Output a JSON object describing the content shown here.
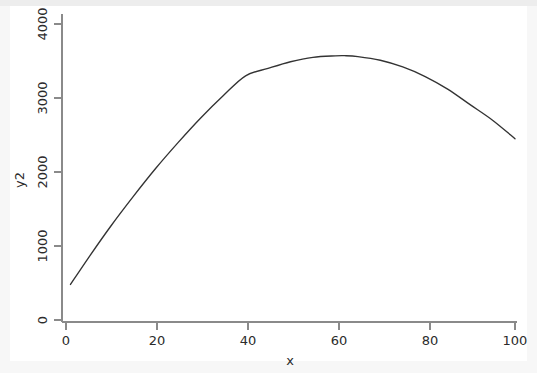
{
  "chart_data": {
    "type": "line",
    "title": "",
    "subtitle": "",
    "xlabel": "x",
    "ylabel": "y2",
    "xlim": [
      0,
      100
    ],
    "ylim": [
      0,
      4000
    ],
    "grid": false,
    "legend": null,
    "legend_position": "none",
    "xticks": [
      0,
      20,
      40,
      60,
      80,
      100
    ],
    "xtick_labels": [
      "0",
      "20",
      "40",
      "60",
      "80",
      "100"
    ],
    "yticks": [
      0,
      1000,
      2000,
      3000,
      4000
    ],
    "ytick_labels": [
      "0",
      "1000",
      "2000",
      "3000",
      "4000"
    ],
    "ytick_label_rotation": 90,
    "series": [
      {
        "name": "y2",
        "color": "#333333",
        "x": [
          1,
          5,
          10,
          15,
          20,
          25,
          30,
          35,
          40,
          45,
          50,
          55,
          60,
          62,
          65,
          70,
          75,
          80,
          85,
          90,
          95,
          100
        ],
        "y": [
          480,
          840,
          1260,
          1660,
          2040,
          2400,
          2740,
          3050,
          3020,
          3180,
          3330,
          3460,
          3550,
          3570,
          3560,
          3520,
          3430,
          3290,
          3120,
          2910,
          2700,
          2450
        ]
      }
    ],
    "fitted_values": {
      "x": [
        1,
        5,
        10,
        15,
        20,
        25,
        30,
        35,
        40,
        45,
        50,
        55,
        60,
        62,
        65,
        70,
        75,
        80,
        85,
        90,
        95,
        100
      ],
      "y": [
        480,
        840,
        1270,
        1670,
        2050,
        2400,
        2730,
        3030,
        3300,
        3400,
        3490,
        3550,
        3570,
        3572,
        3560,
        3510,
        3420,
        3290,
        3120,
        2910,
        2700,
        2450
      ]
    },
    "peak": {
      "x": 62,
      "y": 3570
    }
  },
  "axes": {
    "y_title": "y2",
    "x_title": "x"
  },
  "colors": {
    "page_background": "#f7f7f7",
    "graph_background": "#ffffff",
    "axis": "#8a8a8a",
    "text": "#2b2b2b",
    "series": "#333333"
  }
}
